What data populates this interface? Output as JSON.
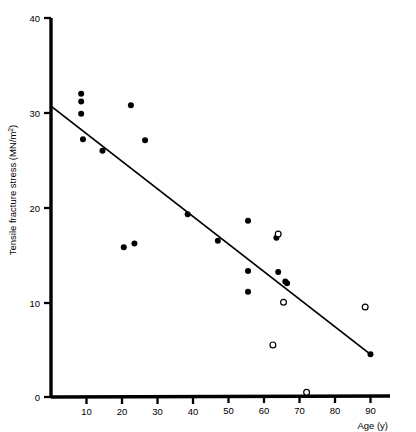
{
  "chart_data": {
    "type": "scatter",
    "title": "",
    "xlabel": "Age (y)",
    "ylabel": "Tensile fracture stress (MN/m²)",
    "ylabel_base": "Tensile fracture stress (MN/m",
    "ylabel_sup": "2",
    "ylabel_tail": ")",
    "xlim": [
      0,
      95
    ],
    "ylim": [
      0,
      40
    ],
    "xticks": [
      10,
      20,
      30,
      40,
      50,
      60,
      70,
      80,
      90
    ],
    "yticks": [
      0,
      10,
      20,
      30,
      40
    ],
    "xtick_labels": [
      "10",
      "20",
      "30",
      "40",
      "50",
      "60",
      "70",
      "80",
      "90"
    ],
    "ytick_labels": [
      "0",
      "10",
      "20",
      "30",
      "40"
    ],
    "grid": false,
    "legend": "none",
    "marker_colors": {
      "filled": "#000000",
      "open_stroke": "#000000",
      "open_fill": "#ffffff",
      "axis": "#000000",
      "trendline": "#000000"
    },
    "series": [
      {
        "name": "filled",
        "marker": "filled-circle",
        "points": [
          [
            8.5,
            32.0
          ],
          [
            8.5,
            31.2
          ],
          [
            8.5,
            29.9
          ],
          [
            9.0,
            27.2
          ],
          [
            14.5,
            26.0
          ],
          [
            22.5,
            30.8
          ],
          [
            26.5,
            27.1
          ],
          [
            20.5,
            15.8
          ],
          [
            23.5,
            16.2
          ],
          [
            38.5,
            19.3
          ],
          [
            47.0,
            16.5
          ],
          [
            55.5,
            18.6
          ],
          [
            55.5,
            13.3
          ],
          [
            55.5,
            11.1
          ],
          [
            63.5,
            16.8
          ],
          [
            64.0,
            13.2
          ],
          [
            66.0,
            12.2
          ],
          [
            66.5,
            12.0
          ],
          [
            90.0,
            4.5
          ]
        ]
      },
      {
        "name": "open",
        "marker": "open-circle",
        "points": [
          [
            64.0,
            17.2
          ],
          [
            65.5,
            10.0
          ],
          [
            62.5,
            5.5
          ],
          [
            88.5,
            9.5
          ],
          [
            72.0,
            0.5
          ]
        ]
      }
    ],
    "trendline": {
      "name": "regression-line",
      "x_start": 0.0,
      "y_start": 30.7,
      "x_end": 90.0,
      "y_end": 4.5
    }
  }
}
